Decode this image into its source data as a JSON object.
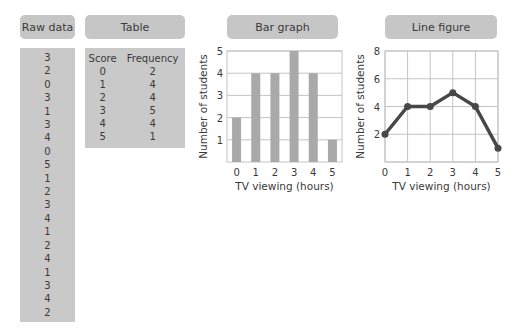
{
  "panels": {
    "raw_data": {
      "title": "Raw data",
      "values": [
        "3",
        "2",
        "0",
        "3",
        "1",
        "3",
        "4",
        "0",
        "5",
        "1",
        "2",
        "3",
        "4",
        "1",
        "2",
        "4",
        "1",
        "3",
        "4",
        "2"
      ]
    },
    "table": {
      "title": "Table",
      "headers": [
        "Score",
        "Frequency"
      ],
      "rows": [
        [
          "0",
          "2"
        ],
        [
          "1",
          "4"
        ],
        [
          "2",
          "4"
        ],
        [
          "3",
          "5"
        ],
        [
          "4",
          "4"
        ],
        [
          "5",
          "1"
        ]
      ]
    },
    "bar_graph": {
      "title": "Bar graph"
    },
    "line_figure": {
      "title": "Line figure"
    }
  },
  "colors": {
    "pill": "#c6c6c6",
    "box": "#c9c9c9",
    "bar": "#a9a9a9",
    "line": "#474747",
    "grid": "#c4c4c4",
    "text": "#3a3a3a"
  },
  "chart_data": [
    {
      "type": "bar",
      "title": "Bar graph",
      "categories": [
        "0",
        "1",
        "2",
        "3",
        "4",
        "5"
      ],
      "values": [
        2,
        4,
        4,
        5,
        4,
        1
      ],
      "xlabel": "TV viewing (hours)",
      "ylabel": "Number of students",
      "ylim": [
        0,
        5
      ],
      "yticks": [
        1,
        2,
        3,
        4,
        5
      ],
      "grid": true
    },
    {
      "type": "line",
      "title": "Line figure",
      "x": [
        0,
        1,
        2,
        3,
        4,
        5
      ],
      "values": [
        2,
        4,
        4,
        5,
        4,
        1
      ],
      "xlabel": "TV viewing (hours)",
      "ylabel": "Number of students",
      "ylim": [
        0,
        8
      ],
      "yticks": [
        2,
        4,
        6,
        8
      ],
      "xticks": [
        0,
        1,
        2,
        3,
        4,
        5
      ],
      "grid": true,
      "markers": true
    }
  ]
}
